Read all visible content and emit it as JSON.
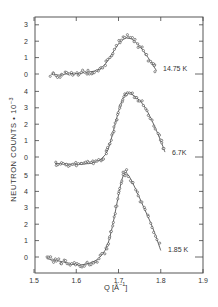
{
  "chart_data": {
    "type": "scatter",
    "title": "",
    "xlabel": "Q [Å⁻¹]",
    "ylabel": "NEUTRON COUNTS • 10⁻³",
    "xlim": [
      1.5,
      1.9
    ],
    "x_ticks": [
      "1.5",
      "1.6",
      "1.7",
      "1.8",
      "1.9"
    ],
    "grid": false,
    "legend": "none (curves labelled inline)",
    "panels": [
      {
        "name": "14.75 K",
        "label": "14.75 K",
        "y_ticks": [
          "0",
          "1",
          "2",
          "3"
        ],
        "ylim": [
          -0.5,
          3.5
        ],
        "x": [
          1.54,
          1.56,
          1.58,
          1.6,
          1.62,
          1.64,
          1.66,
          1.68,
          1.7,
          1.72,
          1.74,
          1.76,
          1.78,
          1.79
        ],
        "values": [
          0.0,
          -0.1,
          0.05,
          0.0,
          0.1,
          0.15,
          0.3,
          1.0,
          1.9,
          2.3,
          2.0,
          1.4,
          0.6,
          0.2
        ]
      },
      {
        "name": "6.7K",
        "label": "6.7K",
        "y_ticks": [
          "0",
          "1",
          "2",
          "3",
          "4"
        ],
        "ylim": [
          -0.5,
          4.5
        ],
        "x": [
          1.55,
          1.57,
          1.59,
          1.61,
          1.63,
          1.65,
          1.67,
          1.68,
          1.69,
          1.7,
          1.71,
          1.72,
          1.74,
          1.76,
          1.78,
          1.8,
          1.81
        ],
        "values": [
          -0.4,
          -0.4,
          -0.45,
          -0.45,
          -0.4,
          -0.3,
          0.1,
          0.8,
          1.8,
          2.8,
          3.6,
          4.0,
          3.7,
          3.2,
          2.2,
          1.0,
          0.3
        ]
      },
      {
        "name": "1.85 K",
        "label": "1.85 K",
        "y_ticks": [
          "0",
          "1",
          "2",
          "3",
          "4",
          "5"
        ],
        "ylim": [
          -0.9,
          5.5
        ],
        "x": [
          1.53,
          1.55,
          1.57,
          1.59,
          1.61,
          1.63,
          1.65,
          1.67,
          1.68,
          1.69,
          1.7,
          1.71,
          1.72,
          1.74,
          1.76,
          1.78,
          1.8
        ],
        "values": [
          -0.1,
          -0.2,
          -0.3,
          -0.45,
          -0.5,
          -0.4,
          -0.2,
          0.4,
          1.2,
          2.4,
          3.8,
          5.0,
          5.2,
          4.2,
          3.0,
          1.9,
          0.4
        ]
      }
    ]
  },
  "axes": {
    "xlabel_main": "Q [Å",
    "xlabel_sup": "−1",
    "xlabel_end": "]",
    "ylabel_main": "NEUTRON COUNTS • 10",
    "ylabel_sup": "−3"
  }
}
